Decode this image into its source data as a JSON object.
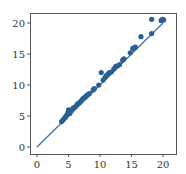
{
  "chart_data": {
    "type": "scatter",
    "title": "",
    "xlabel": "",
    "ylabel": "",
    "xlim": [
      -1,
      22
    ],
    "ylim": [
      -1,
      22
    ],
    "grid": false,
    "legend": null,
    "x_ticks": [
      0,
      5,
      10,
      15,
      20
    ],
    "y_ticks": [
      0,
      5,
      10,
      15,
      20
    ],
    "reference_line": {
      "from": [
        0,
        0
      ],
      "to": [
        20,
        20
      ],
      "color": "#3b6ea5"
    },
    "point_color": "#2b5f93",
    "points": [
      [
        3.9,
        4.1
      ],
      [
        4.1,
        4.3
      ],
      [
        4.3,
        4.6
      ],
      [
        4.5,
        4.8
      ],
      [
        4.6,
        5.0
      ],
      [
        4.8,
        5.2
      ],
      [
        4.9,
        5.5
      ],
      [
        5.0,
        5.8
      ],
      [
        5.0,
        6.0
      ],
      [
        5.2,
        5.4
      ],
      [
        5.3,
        5.7
      ],
      [
        5.5,
        5.9
      ],
      [
        5.6,
        6.1
      ],
      [
        5.8,
        6.3
      ],
      [
        6.0,
        6.4
      ],
      [
        6.2,
        6.6
      ],
      [
        6.4,
        6.9
      ],
      [
        6.6,
        7.0
      ],
      [
        6.8,
        7.2
      ],
      [
        7.0,
        7.4
      ],
      [
        7.2,
        7.7
      ],
      [
        7.4,
        7.9
      ],
      [
        7.6,
        8.0
      ],
      [
        7.8,
        8.2
      ],
      [
        8.0,
        8.4
      ],
      [
        8.3,
        8.6
      ],
      [
        8.9,
        9.2
      ],
      [
        9.1,
        9.4
      ],
      [
        9.8,
        10.0
      ],
      [
        10.2,
        12.0
      ],
      [
        10.5,
        10.8
      ],
      [
        10.8,
        11.2
      ],
      [
        11.0,
        11.5
      ],
      [
        11.3,
        11.8
      ],
      [
        11.5,
        12.0
      ],
      [
        11.8,
        12.1
      ],
      [
        12.2,
        12.6
      ],
      [
        12.5,
        13.0
      ],
      [
        12.8,
        13.1
      ],
      [
        13.1,
        13.3
      ],
      [
        13.6,
        14.0
      ],
      [
        13.8,
        14.2
      ],
      [
        14.8,
        15.2
      ],
      [
        15.2,
        15.9
      ],
      [
        15.6,
        16.1
      ],
      [
        16.5,
        17.8
      ],
      [
        18.2,
        18.3
      ],
      [
        18.2,
        20.6
      ],
      [
        19.7,
        20.4
      ],
      [
        19.9,
        20.6
      ],
      [
        20.1,
        20.5
      ]
    ]
  }
}
